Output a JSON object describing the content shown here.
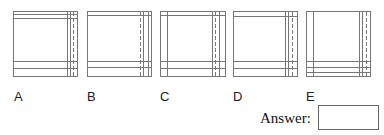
{
  "options": [
    {
      "label": "A",
      "top_lines": 2,
      "bottom_lines": 2,
      "left_inner_line": false,
      "right_pattern": "solid-solid(dashed)-edge"
    },
    {
      "label": "B",
      "top_lines": 1,
      "bottom_lines": 2,
      "left_inner_line": false,
      "right_pattern": "dashed-solid-solid-edge"
    },
    {
      "label": "C",
      "top_lines": 1,
      "bottom_lines": 2,
      "left_inner_line": true,
      "right_pattern": "solid-dashed-solid-edge"
    },
    {
      "label": "D",
      "top_lines": 1,
      "bottom_lines": 2,
      "left_inner_line": false,
      "right_pattern": "solid-dashed-solid-edge"
    },
    {
      "label": "E",
      "top_lines": 0,
      "bottom_lines": 3,
      "left_inner_line": true,
      "right_pattern": "solid-solid-dashed-edge"
    }
  ],
  "answer": {
    "label": "Answer:",
    "value": ""
  },
  "colors": {
    "line": "#777777"
  }
}
